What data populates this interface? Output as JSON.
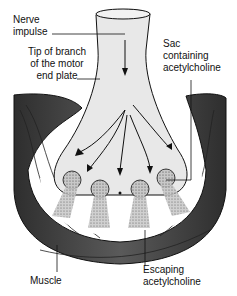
{
  "diagram": {
    "labels": {
      "nerve_impulse_1": "Nerve",
      "nerve_impulse_2": "impulse",
      "tip_1": "Tip of branch",
      "tip_2": "of the motor",
      "tip_3": "end plate",
      "sac_1": "Sac",
      "sac_2": "containing",
      "sac_3": "acetylcholine",
      "muscle": "Muscle",
      "escaping_1": "Escaping",
      "escaping_2": "acetylcholine"
    },
    "colors": {
      "muscle": "#4a4a4a",
      "nerve": "#e6e6e6",
      "sac": "#8a8a8a",
      "line": "#111111"
    }
  }
}
